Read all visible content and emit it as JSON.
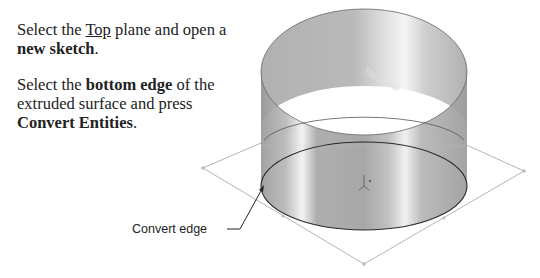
{
  "instructions": {
    "step1": {
      "prefix": "Select the ",
      "plane": "Top",
      "middle": " plane and open a ",
      "action": "new sketch",
      "suffix": "."
    },
    "step2": {
      "prefix": "Select the ",
      "target": "bottom edge",
      "middle": " of the extruded surface and press ",
      "command": "Convert Entities",
      "suffix": "."
    }
  },
  "figure": {
    "plane_label": "Top Plane",
    "callout": "Convert edge"
  }
}
